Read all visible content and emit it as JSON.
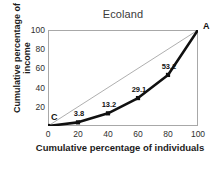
{
  "chart_data": {
    "type": "line",
    "title": "Ecoland",
    "xlabel": "Cumulative percentage of individuals",
    "ylabel": "Cumulative percentage of income",
    "xlim": [
      0,
      100
    ],
    "ylim": [
      0,
      100
    ],
    "xticks": [
      "0",
      "20",
      "40",
      "60",
      "80",
      "100"
    ],
    "xtick_values": [
      0,
      20,
      40,
      60,
      80,
      100
    ],
    "yticks": [
      "20",
      "40",
      "60",
      "80",
      "100"
    ],
    "ytick_values": [
      20,
      40,
      60,
      80,
      100
    ],
    "grid": false,
    "legend": "none",
    "series": [
      {
        "name": "Lorenz curve",
        "x": [
          0,
          20,
          40,
          60,
          80,
          100
        ],
        "values": [
          0,
          3.8,
          13.2,
          29.1,
          53.2,
          100
        ],
        "color": "#101010",
        "marker": "square",
        "point_labels": [
          "",
          "3.8",
          "13.2",
          "29.1",
          "53.2",
          ""
        ]
      },
      {
        "name": "Line of equality",
        "x": [
          0,
          100
        ],
        "values": [
          0,
          100
        ],
        "color": "#9a9a9a",
        "marker": "none",
        "point_labels": [
          "",
          ""
        ]
      }
    ],
    "annotations": [
      {
        "text": "A",
        "x": 100,
        "y": 100,
        "position": "top-right"
      },
      {
        "text": "C",
        "x": 0,
        "y": 0,
        "position": "top-left"
      }
    ],
    "frame_color": "#a8a8a8",
    "background": "#ffffff"
  }
}
